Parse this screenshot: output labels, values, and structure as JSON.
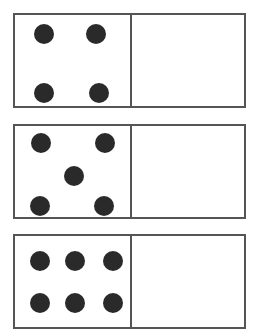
{
  "dominoes": [
    {
      "id": "domino-1",
      "top": 13,
      "left_count": 4,
      "right_count": null,
      "left_pips": [
        [
          29,
          19
        ],
        [
          81,
          19
        ],
        [
          29,
          78
        ],
        [
          84,
          78
        ]
      ]
    },
    {
      "id": "domino-2",
      "top": 124,
      "left_count": 5,
      "right_count": null,
      "left_pips": [
        [
          26,
          17
        ],
        [
          90,
          17
        ],
        [
          59,
          50
        ],
        [
          25,
          80
        ],
        [
          89,
          80
        ]
      ]
    },
    {
      "id": "domino-3",
      "top": 234,
      "left_count": 6,
      "right_count": null,
      "left_pips": [
        [
          25,
          25
        ],
        [
          60,
          25
        ],
        [
          98,
          25
        ],
        [
          25,
          67
        ],
        [
          60,
          67
        ],
        [
          98,
          67
        ]
      ]
    }
  ],
  "colors": {
    "border": "#555555",
    "pip": "#2a2a2a",
    "background": "#ffffff"
  }
}
